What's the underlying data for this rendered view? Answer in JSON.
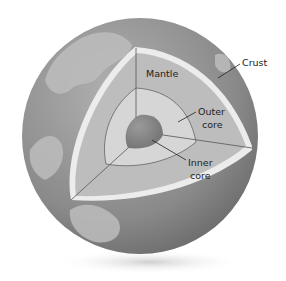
{
  "diagram": {
    "labels": {
      "crust": "Crust",
      "mantle": "Mantle",
      "outer_core_line1": "Outer",
      "outer_core_line2": "core",
      "inner_core_line1": "Inner",
      "inner_core_line2": "core"
    },
    "colors": {
      "ocean": "#8e8e8e",
      "land": "#b8b8b8",
      "crust": "#ececec",
      "mantle": "#bdbdbd",
      "outer_core": "#d6d6d6",
      "inner_core": "#8a8a8a",
      "lines": "#555555"
    }
  }
}
